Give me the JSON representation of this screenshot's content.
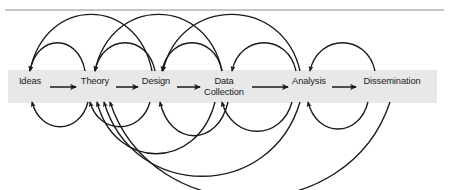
{
  "figure": {
    "width": 449,
    "height": 190,
    "background_color": "#ffffff",
    "rule_color": "#8c8c8c",
    "band_color": "#e8e8e8",
    "arrow_color": "#1a1a1a",
    "text_color": "#1a1a1a"
  },
  "top_rule": {
    "label": "horizontal-rule",
    "y": 10,
    "x_start": 5,
    "x_end": 444
  },
  "band": {
    "label": "stage-band",
    "x": 8,
    "y": 70,
    "width": 429,
    "height": 33
  },
  "stages": [
    {
      "id": "ideas",
      "label": "Ideas",
      "cx": 30,
      "cy": 87
    },
    {
      "id": "theory",
      "label": "Theory",
      "cx": 95,
      "cy": 87
    },
    {
      "id": "design",
      "label": "Design",
      "cx": 156,
      "cy": 87
    },
    {
      "id": "data-collection",
      "label": "Data\nCollection",
      "cx": 224,
      "cy": 87
    },
    {
      "id": "analysis",
      "label": "Analysis",
      "cx": 309,
      "cy": 87
    },
    {
      "id": "dissemination",
      "label": "Dissemination",
      "cx": 392,
      "cy": 87
    }
  ],
  "forward_arrows": [
    {
      "from": "ideas",
      "to": "theory",
      "x1": 50,
      "x2": 76,
      "y": 87
    },
    {
      "from": "theory",
      "to": "design",
      "x1": 116,
      "x2": 138,
      "y": 87
    },
    {
      "from": "design",
      "to": "data-collection",
      "x1": 177,
      "x2": 200,
      "y": 87
    },
    {
      "from": "data-collection",
      "to": "analysis",
      "x1": 252,
      "x2": 288,
      "y": 87
    },
    {
      "from": "analysis",
      "to": "dissemination",
      "x1": 332,
      "x2": 356,
      "y": 87
    }
  ],
  "feedback_arcs_above": [
    {
      "id": "arc-theory-to-ideas-short",
      "from": "theory",
      "to": "ideas",
      "x1": 30,
      "x2": 85,
      "rise": 26
    },
    {
      "id": "arc-design-to-ideas-long",
      "from": "design",
      "to": "ideas",
      "x1": 30,
      "x2": 152,
      "rise": 52
    },
    {
      "id": "arc-datacollection-to-theory-short",
      "from": "data-collection",
      "to": "theory",
      "x1": 95,
      "x2": 155,
      "rise": 26
    },
    {
      "id": "arc-analysis-to-theory-long",
      "from": "analysis",
      "to": "theory",
      "x1": 95,
      "x2": 222,
      "rise": 52
    },
    {
      "id": "arc-analysis-to-design-short",
      "from": "analysis",
      "to": "design",
      "x1": 162,
      "x2": 222,
      "rise": 26
    },
    {
      "id": "arc-dissemination-to-design-long",
      "from": "dissemination",
      "to": "design",
      "x1": 163,
      "x2": 300,
      "rise": 52
    },
    {
      "id": "arc-analysis-to-datacollection-short",
      "from": "analysis",
      "to": "data-collection",
      "x1": 232,
      "x2": 296,
      "rise": 26
    },
    {
      "id": "arc-dissemination-to-analysis-short",
      "from": "dissemination",
      "to": "analysis",
      "x1": 310,
      "x2": 375,
      "rise": 26
    }
  ],
  "feedback_arcs_below": [
    {
      "id": "arc-below-theory-to-ideas",
      "from": "theory",
      "to": "ideas",
      "x1": 32,
      "x2": 88,
      "drop": 22
    },
    {
      "id": "arc-below-design-to-theory",
      "from": "design",
      "to": "theory",
      "x1": 90,
      "x2": 150,
      "drop": 22
    },
    {
      "id": "arc-below-datacollection-to-theory",
      "from": "data-collection",
      "to": "theory",
      "x1": 97,
      "x2": 215,
      "drop": 46
    },
    {
      "id": "arc-below-analysis-to-theory",
      "from": "analysis",
      "to": "theory",
      "x1": 104,
      "x2": 300,
      "drop": 66
    },
    {
      "id": "arc-below-datacollection-to-design",
      "from": "data-collection",
      "to": "design",
      "x1": 160,
      "x2": 228,
      "drop": 30
    },
    {
      "id": "arc-below-analysis-to-datacollection",
      "from": "analysis",
      "to": "data-collection",
      "x1": 222,
      "x2": 292,
      "drop": 26
    },
    {
      "id": "arc-below-dissemination-to-analysis",
      "from": "dissemination",
      "to": "analysis",
      "x1": 308,
      "x2": 368,
      "drop": 24
    },
    {
      "id": "arc-below-dissemination-to-theory",
      "from": "dissemination",
      "to": "theory",
      "x1": 110,
      "x2": 390,
      "drop": 85
    }
  ]
}
